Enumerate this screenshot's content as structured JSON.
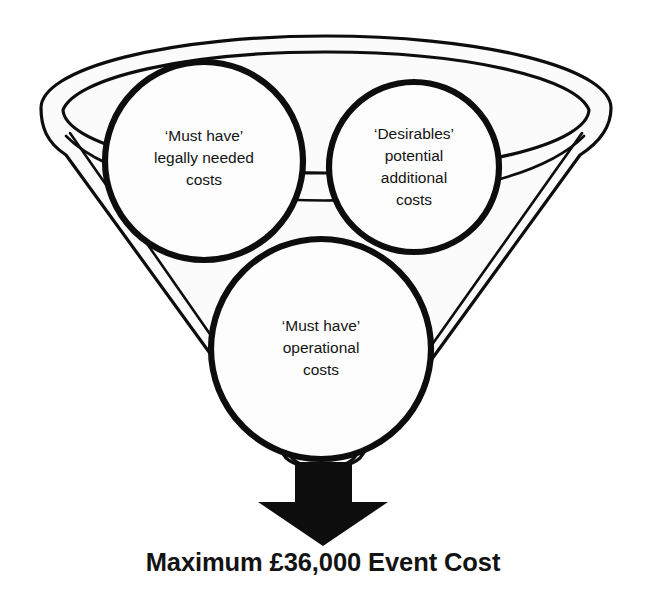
{
  "diagram": {
    "type": "funnel",
    "background_color": "#ffffff",
    "stroke_color": "#0d0d0d",
    "fill_color": "#fbfbfb"
  },
  "funnel": {
    "rim_label": "funnel-rim",
    "body_label": "funnel-cone"
  },
  "bubbles": [
    {
      "id": "must-have-legal",
      "cx": 204,
      "cy": 161,
      "r": 99,
      "lines": [
        "‘Must have’",
        "legally needed",
        "costs"
      ]
    },
    {
      "id": "desirables",
      "cx": 414,
      "cy": 167,
      "r": 85,
      "lines": [
        "‘Desirables’",
        "potential",
        "additional",
        "costs"
      ]
    },
    {
      "id": "must-have-operational",
      "cx": 321,
      "cy": 349,
      "r": 110,
      "lines": [
        "‘Must have’",
        "operational",
        "costs"
      ]
    }
  ],
  "arrow": {
    "name": "down-arrow",
    "color": "#0d0d0d"
  },
  "caption": {
    "text": "Maximum £36,000 Event Cost",
    "amount": "£36,000",
    "color": "#131313"
  }
}
